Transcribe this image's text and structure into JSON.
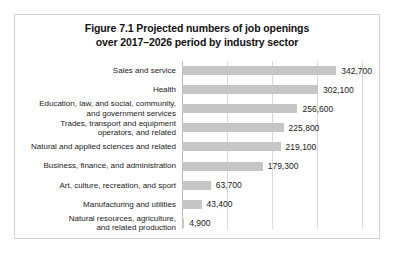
{
  "figure": {
    "title_line_1": "Figure 7.1 Projected numbers of job openings",
    "title_line_2": "over 2017–2026 period by industry sector"
  },
  "chart_data": {
    "type": "bar",
    "orientation": "horizontal",
    "title": "Figure 7.1 Projected numbers of job openings over 2017–2026 period by industry sector",
    "xlabel": "",
    "ylabel": "",
    "xlim": [
      0,
      400000
    ],
    "gridlines": [
      0,
      100000,
      200000,
      300000,
      400000
    ],
    "grid": true,
    "legend": false,
    "bar_color": "#c6c6c6",
    "categories": [
      "Sales and service",
      "Health",
      "Education, law, and social, community,\nand government services",
      "Trades, transport and equipment\noperators, and related",
      "Natural and applied sciences and related",
      "Business, finance, and administration",
      "Art, culture, recreation, and sport",
      "Manufacturing and utilities",
      "Natural resources, agriculture,\nand related production"
    ],
    "values": [
      342700,
      302100,
      256600,
      225800,
      219100,
      179300,
      63700,
      43400,
      4900
    ],
    "value_labels": [
      "342,700",
      "302,100",
      "256,600",
      "225,800",
      "219,100",
      "179,300",
      "63,700",
      "43,400",
      "4,900"
    ]
  }
}
